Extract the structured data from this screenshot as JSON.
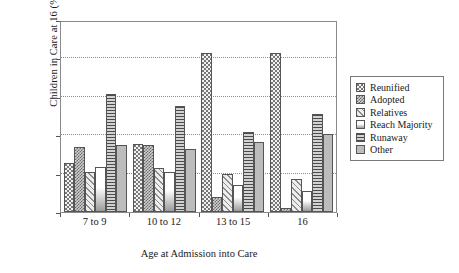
{
  "chart_data": {
    "type": "bar",
    "title": "",
    "xlabel": "Age at Admission into Care",
    "ylabel": "Children in Care at 16 (%)",
    "categories": [
      "7 to 9",
      "10 to 12",
      "13 to 15",
      "16"
    ],
    "ylim": [
      0,
      50
    ],
    "yticks": [
      0,
      10,
      20,
      30,
      40,
      50
    ],
    "grid": true,
    "legend_position": "right",
    "series": [
      {
        "name": "Reunified",
        "pattern": "dotted-checker",
        "values": [
          12.7,
          17.8,
          41.5,
          41.4
        ]
      },
      {
        "name": "Adopted",
        "pattern": "dense-checker",
        "values": [
          17.0,
          17.4,
          4.0,
          1.0
        ]
      },
      {
        "name": "Relatives",
        "pattern": "diagonal-hatch",
        "values": [
          10.3,
          11.4,
          10.0,
          8.5
        ]
      },
      {
        "name": "Reach Majority",
        "pattern": "gradient",
        "values": [
          11.7,
          10.4,
          7.0,
          5.6
        ]
      },
      {
        "name": "Runaway",
        "pattern": "horizontal-lines",
        "values": [
          30.8,
          27.7,
          20.8,
          25.4
        ]
      },
      {
        "name": "Other",
        "pattern": "solid-gray",
        "values": [
          17.4,
          16.3,
          18.2,
          20.4
        ]
      }
    ]
  },
  "colors": {
    "axis": "#555555",
    "frame": "#8a8a8a",
    "gridline": "#8e8e8e",
    "bar_outline": "#555555",
    "background": "#ffffff"
  }
}
